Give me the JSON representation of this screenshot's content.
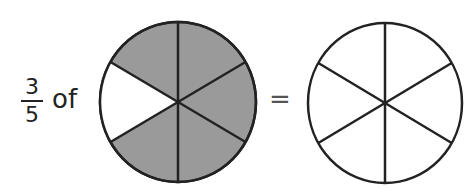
{
  "fraction": {
    "numerator": "3",
    "denominator": "5"
  },
  "of_text": "of",
  "equals_text": "=",
  "colors": {
    "shaded": "#9a9a9a",
    "stroke": "#222222",
    "unshaded": "#ffffff"
  },
  "left_circle": {
    "sectors": 6,
    "shaded_sectors": 5,
    "unshaded_position": "left"
  },
  "right_circle": {
    "sectors": 6,
    "shaded_sectors": 0
  }
}
